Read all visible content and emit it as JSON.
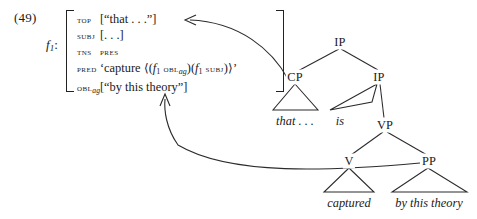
{
  "example": {
    "number": "(49)"
  },
  "fstructure": {
    "label": "f",
    "label_sub": "1",
    "label_colon": ":",
    "rows": [
      {
        "attr": "TOP",
        "attr_sub": "",
        "value": "[“that . . .”]"
      },
      {
        "attr": "SUBJ",
        "attr_sub": "",
        "value": "[. . .]"
      },
      {
        "attr": "TNS",
        "attr_sub": "",
        "value": "PRES"
      },
      {
        "attr": "PRED",
        "attr_sub": "",
        "value": "‘capture ⟨(f₁ OBLₐ₉)(f₁ SUBJ)⟩’"
      },
      {
        "attr": "OBL",
        "attr_sub": "ag",
        "value": "[“by this theory”]"
      }
    ],
    "pred": {
      "open_quote": "‘",
      "stem": "capture",
      "angle_open": "⟨",
      "arg1_open": "(",
      "arg1_f": "f",
      "arg1_sub": "1",
      "arg1_attr": "OBL",
      "arg1_attr_sub": "ag",
      "arg1_close": ")",
      "arg2_open": "(",
      "arg2_f": "f",
      "arg2_sub": "1",
      "arg2_attr": "SUBJ",
      "arg2_close": ")",
      "angle_close": "⟩",
      "close_quote": "’"
    }
  },
  "tree": {
    "nodes": [
      {
        "name": "ip-root",
        "label": "IP"
      },
      {
        "name": "cp",
        "label": "CP"
      },
      {
        "name": "ip-lower",
        "label": "IP"
      },
      {
        "name": "vp",
        "label": "VP"
      },
      {
        "name": "v",
        "label": "V"
      },
      {
        "name": "pp",
        "label": "PP"
      }
    ],
    "leaves": [
      {
        "name": "leaf-that",
        "label": "that . . ."
      },
      {
        "name": "leaf-is",
        "label": "is"
      },
      {
        "name": "leaf-captured",
        "label": "captured"
      },
      {
        "name": "leaf-by-theory",
        "label": "by this theory"
      }
    ]
  },
  "arrows": [
    {
      "name": "arrow-top-to-cp",
      "from": "CP",
      "to": "TOP"
    },
    {
      "name": "arrow-obl-to-pp",
      "from": "PP",
      "to": "OBL_ag"
    }
  ],
  "colors": {
    "ink": "#1a1a1a",
    "line": "#2b2b2b",
    "background": "#ffffff"
  }
}
